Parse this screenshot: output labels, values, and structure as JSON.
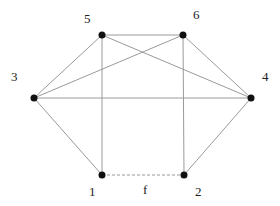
{
  "graph": {
    "nodes": [
      {
        "id": "1",
        "label": "1",
        "x": 102,
        "y": 175,
        "lx": 89,
        "ly": 196
      },
      {
        "id": "2",
        "label": "2",
        "x": 184,
        "y": 175,
        "lx": 195,
        "ly": 196
      },
      {
        "id": "3",
        "label": "3",
        "x": 34,
        "y": 98,
        "lx": 11,
        "ly": 81
      },
      {
        "id": "4",
        "label": "4",
        "x": 251,
        "y": 98,
        "lx": 262,
        "ly": 81
      },
      {
        "id": "5",
        "label": "5",
        "x": 102,
        "y": 35,
        "lx": 84,
        "ly": 23
      },
      {
        "id": "6",
        "label": "6",
        "x": 183,
        "y": 35,
        "lx": 193,
        "ly": 19
      }
    ],
    "edges": [
      {
        "from": "5",
        "to": "6",
        "style": "solid"
      },
      {
        "from": "5",
        "to": "3",
        "style": "solid"
      },
      {
        "from": "5",
        "to": "4",
        "style": "solid"
      },
      {
        "from": "5",
        "to": "1",
        "style": "solid"
      },
      {
        "from": "6",
        "to": "3",
        "style": "solid"
      },
      {
        "from": "6",
        "to": "4",
        "style": "solid"
      },
      {
        "from": "6",
        "to": "2",
        "style": "solid"
      },
      {
        "from": "3",
        "to": "4",
        "style": "solid"
      },
      {
        "from": "3",
        "to": "1",
        "style": "solid"
      },
      {
        "from": "4",
        "to": "2",
        "style": "solid"
      },
      {
        "from": "1",
        "to": "2",
        "style": "dashed",
        "label": "f"
      }
    ],
    "edge_label": {
      "text": "f",
      "x": 143,
      "y": 194
    },
    "colors": {
      "edge": "#9a9a9a",
      "node": "#111111",
      "label": "#222222"
    }
  }
}
